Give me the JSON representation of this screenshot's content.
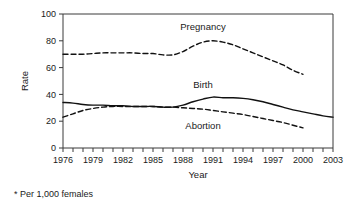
{
  "footnote": "* Per 1,000 females",
  "chart_data": {
    "type": "line",
    "title": "",
    "xlabel": "Year",
    "ylabel": "Rate",
    "xlim": [
      1976,
      2003
    ],
    "ylim": [
      0,
      100
    ],
    "grid": false,
    "legend_position": "inline-annotations",
    "ytick_labels": [
      "0",
      "20",
      "40",
      "60",
      "80",
      "100"
    ],
    "ytick_values": [
      0,
      20,
      40,
      60,
      80,
      100
    ],
    "xtick_labels": [
      "1976",
      "1979",
      "1982",
      "1985",
      "1988",
      "1991",
      "1994",
      "1997",
      "2000",
      "2003"
    ],
    "xtick_values": [
      1976,
      1979,
      1982,
      1985,
      1988,
      1991,
      1994,
      1997,
      2000,
      2003
    ],
    "x": [
      1976,
      1977,
      1978,
      1979,
      1980,
      1981,
      1982,
      1983,
      1984,
      1985,
      1986,
      1987,
      1988,
      1989,
      1990,
      1991,
      1992,
      1993,
      1994,
      1995,
      1996,
      1997,
      1998,
      1999,
      2000,
      2001,
      2002,
      2003
    ],
    "series": [
      {
        "name": "Pregnancy",
        "style": "dashed",
        "color": "#111111",
        "label_text": "Pregnancy",
        "values": [
          70,
          70,
          70,
          70.5,
          71,
          71,
          71,
          71,
          70.5,
          70.5,
          69.5,
          69.5,
          72,
          76,
          79,
          80,
          79,
          77,
          74,
          71,
          68,
          65,
          62,
          58,
          55,
          null,
          null,
          null
        ]
      },
      {
        "name": "Birth",
        "style": "solid",
        "color": "#111111",
        "label_text": "Birth",
        "values": [
          34,
          33.5,
          32.5,
          32,
          32,
          31.5,
          31.5,
          31,
          31,
          31,
          30.5,
          30.5,
          32,
          34.5,
          36.5,
          38,
          37.5,
          37.5,
          37,
          36,
          34.5,
          32.5,
          30.5,
          28.5,
          27,
          25.5,
          24,
          23
        ]
      },
      {
        "name": "Abortion",
        "style": "dashed",
        "color": "#111111",
        "label_text": "Abortion",
        "values": [
          23,
          25.5,
          28,
          29.5,
          30.5,
          31,
          31,
          31,
          31,
          31,
          30.5,
          30.5,
          30,
          29.5,
          29,
          28,
          27,
          26,
          25,
          23.5,
          22,
          20.5,
          19,
          17,
          15,
          null,
          null,
          null
        ]
      }
    ],
    "annotations": [
      {
        "text": "Pregnancy",
        "x": 1990,
        "y": 88
      },
      {
        "text": "Birth",
        "x": 1990,
        "y": 45
      },
      {
        "text": "Abortion",
        "x": 1990,
        "y": 14
      }
    ]
  }
}
